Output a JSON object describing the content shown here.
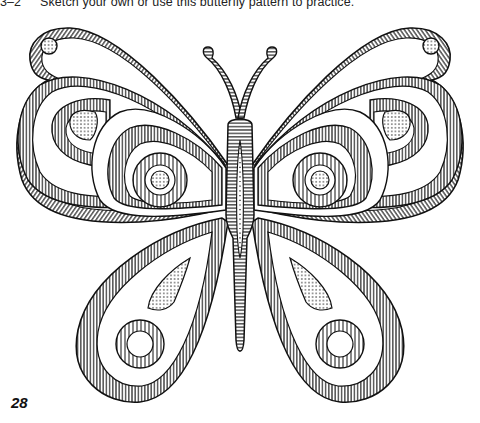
{
  "caption": {
    "figure_number": "3–2",
    "text": "Sketch your own or use this butterfly pattern to practice."
  },
  "illustration": {
    "subject": "butterfly line-art pattern",
    "colors": {
      "ink": "#111111",
      "paper": "#ffffff"
    }
  },
  "page_number": "28"
}
